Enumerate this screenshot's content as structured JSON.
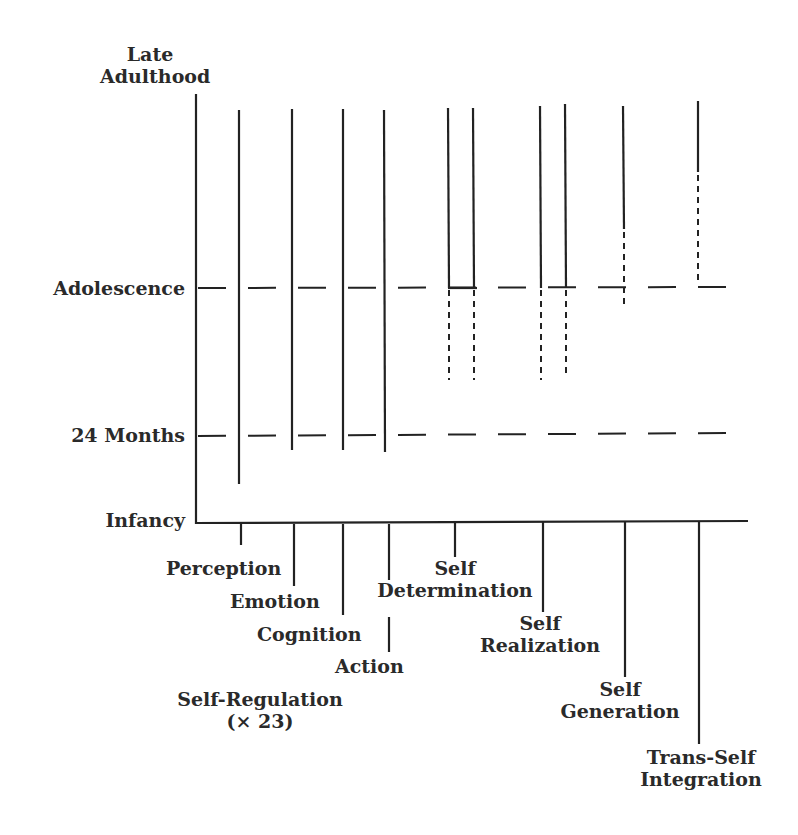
{
  "y_axis": {
    "labels": {
      "late_adulthood_1": "Late",
      "late_adulthood_2": "Adulthood",
      "adolescence": "Adolescence",
      "months_24": "24 Months",
      "infancy": "Infancy"
    }
  },
  "x_axis": {
    "labels": {
      "perception": "Perception",
      "emotion": "Emotion",
      "cognition": "Cognition",
      "action": "Action",
      "self_regulation": "Self-Regulation",
      "self_regulation_count": "(× 23)",
      "self_determination_1": "Self",
      "self_determination_2": "Determination",
      "self_realization_1": "Self",
      "self_realization_2": "Realization",
      "self_generation_1": "Self",
      "self_generation_2": "Generation",
      "trans_self_1": "Trans-Self",
      "trans_self_2": "Integration"
    }
  },
  "colors": {
    "ink": "#222222",
    "background": "#ffffff"
  }
}
